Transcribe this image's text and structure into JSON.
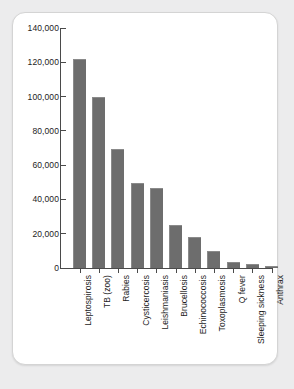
{
  "chart_data": {
    "type": "bar",
    "title": "",
    "subtitle": "",
    "xlabel": "",
    "ylabel": "",
    "ylim": [
      0,
      140000
    ],
    "grid": false,
    "legend": "none",
    "orientation": "vertical",
    "bar_color": "#6d6d6d",
    "axis_color": "#4a4a4a",
    "background_color": "#ffffff",
    "page_background_color": "#ececed",
    "categories": [
      "Leptospirosis",
      "TB (zoo)",
      "Rabies",
      "Cysticercosis",
      "Leishmaniasis",
      "Brucellosis",
      "Echinococcosis",
      "Toxoplasmosis",
      "Q fever",
      "Sleeping sickness",
      "Anthrax"
    ],
    "values": [
      122000,
      99500,
      69500,
      49500,
      46500,
      25000,
      18000,
      10000,
      3500,
      2500,
      1200
    ],
    "ytick_values": [
      140000,
      120000,
      100000,
      80000,
      60000,
      40000,
      20000,
      0
    ],
    "ytick_labels": [
      "140,000",
      "120,000",
      "100,000",
      "80,000",
      "60,000",
      "40,000",
      "20,000",
      "0"
    ]
  }
}
